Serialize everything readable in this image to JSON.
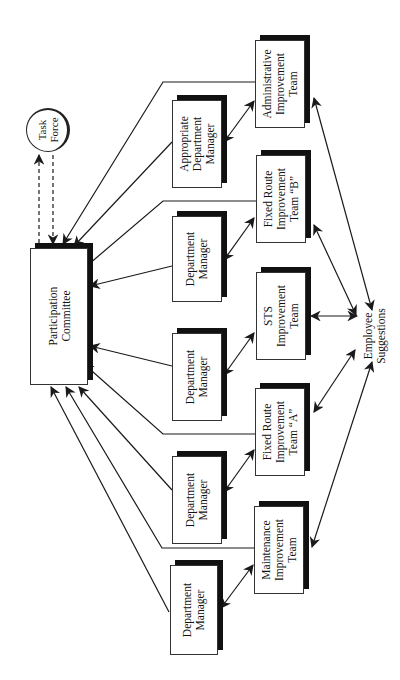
{
  "diagram": {
    "nodes": {
      "participation_committee": {
        "label": "Participation\nCommittee",
        "x": 30,
        "y": 248,
        "w": 58,
        "h": 137
      },
      "task_force": {
        "label": "Task\nForce",
        "cx": 48,
        "cy": 130,
        "r": 22
      },
      "appropriate_department_manager": {
        "label": "Appropriate\nDepartment\nManager",
        "x": 172,
        "y": 100,
        "w": 50,
        "h": 88
      },
      "department_manager_1": {
        "label": "Department\nManager",
        "x": 172,
        "y": 216,
        "w": 50,
        "h": 86
      },
      "department_manager_2": {
        "label": "Department\nManager",
        "x": 172,
        "y": 333,
        "w": 50,
        "h": 88
      },
      "department_manager_3": {
        "label": "Department\nManager",
        "x": 172,
        "y": 456,
        "w": 50,
        "h": 88
      },
      "department_manager_4": {
        "label": "Department\nManager",
        "x": 170,
        "y": 565,
        "w": 48,
        "h": 90
      },
      "administrative_improvement_team": {
        "label": "Administrative\nImprovement\nTeam",
        "x": 255,
        "y": 40,
        "w": 50,
        "h": 88
      },
      "fixed_route_team_b": {
        "label": "Fixed Route\nImprovement\nTeam “B”",
        "x": 256,
        "y": 155,
        "w": 50,
        "h": 88
      },
      "sts_improvement_team": {
        "label": "STS\nImprovement\nTeam",
        "x": 256,
        "y": 272,
        "w": 50,
        "h": 88
      },
      "fixed_route_team_a": {
        "label": "Fixed Route\nImprovement\nTeam “A”",
        "x": 255,
        "y": 388,
        "w": 50,
        "h": 88
      },
      "maintenance_improvement_team": {
        "label": "Maintenance\nImprovement\nTeam",
        "x": 254,
        "y": 506,
        "w": 50,
        "h": 88
      },
      "employee_suggestions": {
        "label": "Employee\nSuggestions",
        "cx": 375,
        "cy": 336
      }
    },
    "edges": [
      {
        "from": "task_force",
        "to": "participation_committee",
        "style": "dashed",
        "arrow": "end",
        "label": "down"
      },
      {
        "from": "participation_committee",
        "to": "task_force",
        "style": "dashed",
        "arrow": "end",
        "label": "up"
      },
      {
        "from": "administrative_improvement_team",
        "to": "participation_committee",
        "style": "solid",
        "arrow": "end"
      },
      {
        "from": "appropriate_department_manager",
        "to": "participation_committee",
        "style": "solid",
        "arrow": "end"
      },
      {
        "from": "fixed_route_team_b",
        "to": "participation_committee",
        "style": "solid",
        "arrow": "end"
      },
      {
        "from": "department_manager_1",
        "to": "participation_committee",
        "style": "solid",
        "arrow": "end"
      },
      {
        "from": "department_manager_2",
        "to": "participation_committee",
        "style": "solid",
        "arrow": "end"
      },
      {
        "from": "fixed_route_team_a",
        "to": "participation_committee",
        "style": "solid",
        "arrow": "end"
      },
      {
        "from": "department_manager_3",
        "to": "participation_committee",
        "style": "solid",
        "arrow": "end"
      },
      {
        "from": "maintenance_improvement_team",
        "to": "participation_committee",
        "style": "solid",
        "arrow": "end"
      },
      {
        "from": "department_manager_4",
        "to": "participation_committee",
        "style": "solid",
        "arrow": "end"
      },
      {
        "from": "appropriate_department_manager",
        "to": "administrative_improvement_team",
        "style": "solid",
        "arrow": "both"
      },
      {
        "from": "department_manager_1",
        "to": "fixed_route_team_b",
        "style": "solid",
        "arrow": "both"
      },
      {
        "from": "department_manager_2",
        "to": "sts_improvement_team",
        "style": "solid",
        "arrow": "both"
      },
      {
        "from": "department_manager_3",
        "to": "fixed_route_team_a",
        "style": "solid",
        "arrow": "both"
      },
      {
        "from": "department_manager_4",
        "to": "maintenance_improvement_team",
        "style": "solid",
        "arrow": "both"
      },
      {
        "from": "employee_suggestions",
        "to": "administrative_improvement_team",
        "style": "solid",
        "arrow": "both"
      },
      {
        "from": "employee_suggestions",
        "to": "fixed_route_team_b",
        "style": "solid",
        "arrow": "both"
      },
      {
        "from": "employee_suggestions",
        "to": "sts_improvement_team",
        "style": "solid",
        "arrow": "both"
      },
      {
        "from": "employee_suggestions",
        "to": "fixed_route_team_a",
        "style": "solid",
        "arrow": "both"
      },
      {
        "from": "employee_suggestions",
        "to": "maintenance_improvement_team",
        "style": "solid",
        "arrow": "both"
      }
    ],
    "colors": {
      "line": "#1a1a1a",
      "shadow": "#111111",
      "box_border": "#333333",
      "background": "#ffffff"
    }
  }
}
